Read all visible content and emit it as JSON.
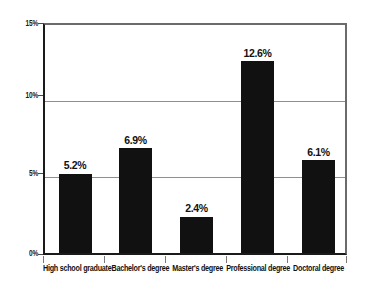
{
  "chart_data": {
    "type": "bar",
    "title": "",
    "subtitle": "",
    "xlabel": "",
    "ylabel": "",
    "categories": [
      "High school graduate",
      "Bachelor's degree",
      "Master's degree",
      "Professional degree",
      "Doctoral degree"
    ],
    "values": [
      5.2,
      6.9,
      2.4,
      12.6,
      6.1
    ],
    "data_labels": [
      "5.2%",
      "6.9%",
      "2.4%",
      "12.6%",
      "6.1%"
    ],
    "ylim": [
      0,
      15
    ],
    "yticks": [
      0,
      5,
      10,
      15
    ],
    "ytick_labels": [
      "0%",
      "5%",
      "10%",
      "15%"
    ],
    "grid": true,
    "grid_axis": "y",
    "legend": false,
    "legend_position": "none",
    "bar_color": "#111111",
    "gridline_color": "#8f8f8f",
    "axis_color": "#1a1a1a",
    "background_color": "#ffffff",
    "text_color": "#111111"
  }
}
